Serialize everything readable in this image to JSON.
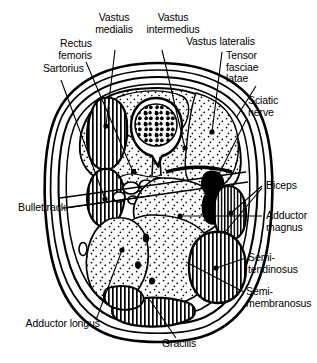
{
  "figure": {
    "view": "axial cross-section",
    "background_color": "#ffffff",
    "ink_color": "#000000"
  },
  "labels": {
    "sartorius": "Sartorius",
    "rectus_femoris": "Rectus\nfemoris",
    "vastus_medialis": "Vastus\nmedialis",
    "vastus_intermedius": "Vastus\nintermedius",
    "vastus_lateralis": "Vastus lateralis",
    "tensor_fasciae_latae": "Tensor\nfasciae\nlatae",
    "sciatic_nerve": "Sciatic\nnerve",
    "biceps": "Biceps",
    "adductor_magnus": "Adductor\nmagnus",
    "semitendinosus": "Semi-\ntendinosus",
    "semimembranosus": "Semi-\nmembranosus",
    "gracilis": "Gracilis",
    "adductor_longus": "Adductor longus",
    "bullettrack": "Bullettrack"
  },
  "structures": [
    {
      "name": "femur",
      "fill": "bone-marrow-mottled",
      "note": "central bone with cortical ring and trabecular marrow"
    },
    {
      "name": "vastus-medialis",
      "fill": "hatched"
    },
    {
      "name": "sartorius",
      "fill": "hatched"
    },
    {
      "name": "rectus-femoris",
      "fill": "stippled"
    },
    {
      "name": "vastus-intermedius",
      "fill": "stippled"
    },
    {
      "name": "vastus-lateralis",
      "fill": "stippled"
    },
    {
      "name": "tensor-fasciae-latae",
      "fill": "stippled"
    },
    {
      "name": "biceps-femoris",
      "fill": "hatched"
    },
    {
      "name": "semitendinosus",
      "fill": "hatched"
    },
    {
      "name": "semimembranosus",
      "fill": "stippled"
    },
    {
      "name": "adductor-magnus",
      "fill": "stippled"
    },
    {
      "name": "adductor-longus",
      "fill": "stippled"
    },
    {
      "name": "gracilis",
      "fill": "hatched"
    },
    {
      "name": "sciatic-nerve",
      "fill": "solid-black"
    },
    {
      "name": "femoral-vessels",
      "fill": "outline"
    },
    {
      "name": "bullet-track",
      "fill": "line"
    }
  ]
}
